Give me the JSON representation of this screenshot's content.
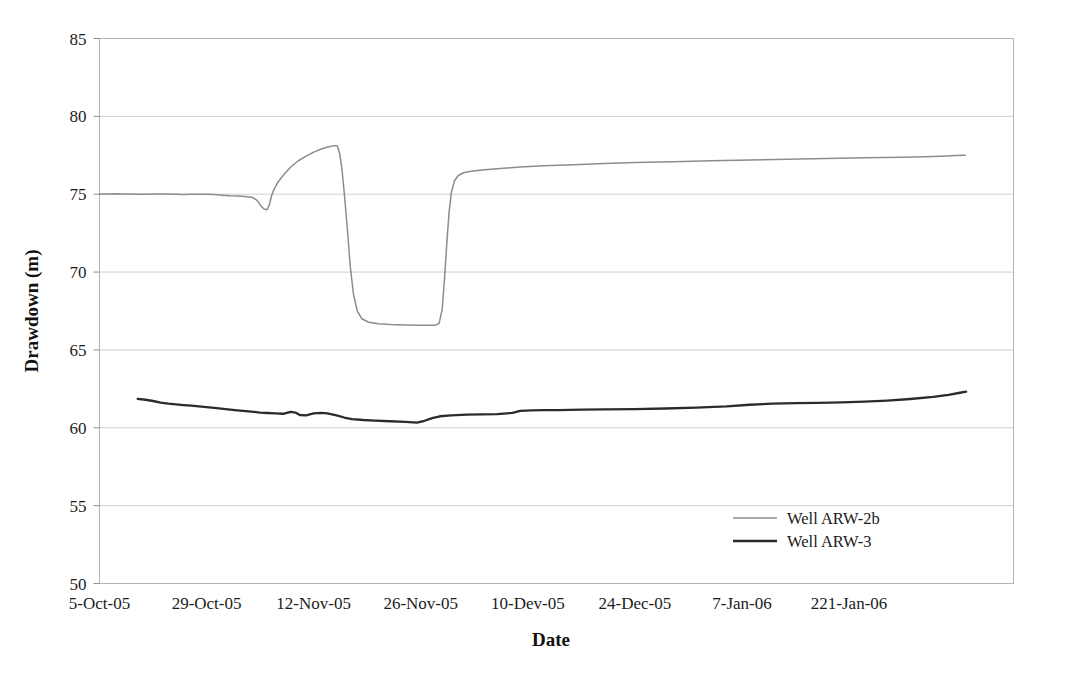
{
  "chart_data": {
    "type": "line",
    "title": "",
    "xlabel": "Date",
    "ylabel": "Drawdown (m)",
    "ylim": [
      50,
      85
    ],
    "yticks": [
      50,
      55,
      60,
      65,
      70,
      75,
      80,
      85
    ],
    "ytick_labels": [
      "50",
      "55",
      "60",
      "65",
      "70",
      "75",
      "80",
      "85"
    ],
    "xtick_labels": [
      "5-Oct-05",
      "29-Oct-05",
      "12-Nov-05",
      "26-Nov-05",
      "10-Dev-05",
      "24-Dec-05",
      "7-Jan-06",
      "221-Jan-06"
    ],
    "grid": "horizontal",
    "legend_position": "inside-bottom-right",
    "colors": {
      "series_1": "#8c8c8c",
      "series_2": "#2b2b2b",
      "grid": "#c8c8c8",
      "frame": "#b4b4b4",
      "text": "#1c1c1c"
    },
    "series": [
      {
        "name": "Well ARW-2b",
        "color": "#8c8c8c",
        "points": [
          [
            0.0,
            75.02
          ],
          [
            1.0,
            75.02
          ],
          [
            2.0,
            75.03
          ],
          [
            3.0,
            75.02
          ],
          [
            4.0,
            75.01
          ],
          [
            5.0,
            75.0
          ],
          [
            6.0,
            75.0
          ],
          [
            7.0,
            75.01
          ],
          [
            8.0,
            75.02
          ],
          [
            9.0,
            75.02
          ],
          [
            10.0,
            75.0
          ],
          [
            11.0,
            74.98
          ],
          [
            12.0,
            74.99
          ],
          [
            13.0,
            75.0
          ],
          [
            14.0,
            75.0
          ],
          [
            15.0,
            74.98
          ],
          [
            16.0,
            74.94
          ],
          [
            17.0,
            74.9
          ],
          [
            18.0,
            74.88
          ],
          [
            19.0,
            74.86
          ],
          [
            20.0,
            74.8
          ],
          [
            20.6,
            74.6
          ],
          [
            21.1,
            74.25
          ],
          [
            21.5,
            74.05
          ],
          [
            21.9,
            74.0
          ],
          [
            22.2,
            74.3
          ],
          [
            22.5,
            74.9
          ],
          [
            22.8,
            75.3
          ],
          [
            23.3,
            75.75
          ],
          [
            24.0,
            76.2
          ],
          [
            25.0,
            76.75
          ],
          [
            26.0,
            77.15
          ],
          [
            27.0,
            77.45
          ],
          [
            28.0,
            77.7
          ],
          [
            29.0,
            77.9
          ],
          [
            30.0,
            78.05
          ],
          [
            30.7,
            78.12
          ],
          [
            31.1,
            78.1
          ],
          [
            31.4,
            77.6
          ],
          [
            31.7,
            76.6
          ],
          [
            32.0,
            75.1
          ],
          [
            32.4,
            72.8
          ],
          [
            32.8,
            70.3
          ],
          [
            33.2,
            68.6
          ],
          [
            33.7,
            67.5
          ],
          [
            34.3,
            67.0
          ],
          [
            35.2,
            66.78
          ],
          [
            36.5,
            66.68
          ],
          [
            38.0,
            66.63
          ],
          [
            40.0,
            66.6
          ],
          [
            42.0,
            66.58
          ],
          [
            43.8,
            66.58
          ],
          [
            44.4,
            66.7
          ],
          [
            44.8,
            67.6
          ],
          [
            45.1,
            69.5
          ],
          [
            45.4,
            71.8
          ],
          [
            45.7,
            73.8
          ],
          [
            46.0,
            75.1
          ],
          [
            46.4,
            75.85
          ],
          [
            46.9,
            76.2
          ],
          [
            47.6,
            76.38
          ],
          [
            48.6,
            76.48
          ],
          [
            50.0,
            76.56
          ],
          [
            52.0,
            76.64
          ],
          [
            55.0,
            76.74
          ],
          [
            58.0,
            76.82
          ],
          [
            62.0,
            76.9
          ],
          [
            66.0,
            76.97
          ],
          [
            70.0,
            77.03
          ],
          [
            75.0,
            77.09
          ],
          [
            80.0,
            77.15
          ],
          [
            85.0,
            77.2
          ],
          [
            90.0,
            77.25
          ],
          [
            95.0,
            77.3
          ],
          [
            100.0,
            77.34
          ],
          [
            105.0,
            77.38
          ],
          [
            108.0,
            77.41
          ],
          [
            110.0,
            77.44
          ],
          [
            112.0,
            77.48
          ],
          [
            113.2,
            77.51
          ]
        ]
      },
      {
        "name": "Well ARW-3",
        "color": "#2b2b2b",
        "points": [
          [
            5.0,
            61.85
          ],
          [
            6.0,
            61.8
          ],
          [
            7.0,
            61.72
          ],
          [
            8.0,
            61.62
          ],
          [
            9.0,
            61.55
          ],
          [
            10.0,
            61.5
          ],
          [
            11.0,
            61.46
          ],
          [
            12.0,
            61.42
          ],
          [
            13.0,
            61.38
          ],
          [
            14.0,
            61.33
          ],
          [
            15.0,
            61.28
          ],
          [
            16.5,
            61.2
          ],
          [
            18.0,
            61.12
          ],
          [
            19.5,
            61.05
          ],
          [
            21.0,
            60.98
          ],
          [
            22.0,
            60.95
          ],
          [
            23.0,
            60.92
          ],
          [
            24.0,
            60.9
          ],
          [
            25.0,
            61.02
          ],
          [
            25.6,
            60.98
          ],
          [
            26.2,
            60.82
          ],
          [
            27.0,
            60.8
          ],
          [
            28.0,
            60.92
          ],
          [
            29.0,
            60.96
          ],
          [
            29.8,
            60.92
          ],
          [
            31.0,
            60.8
          ],
          [
            32.0,
            60.66
          ],
          [
            33.0,
            60.56
          ],
          [
            34.5,
            60.5
          ],
          [
            36.0,
            60.46
          ],
          [
            38.0,
            60.42
          ],
          [
            40.0,
            60.38
          ],
          [
            41.5,
            60.33
          ],
          [
            42.5,
            60.45
          ],
          [
            43.5,
            60.62
          ],
          [
            44.5,
            60.74
          ],
          [
            46.0,
            60.8
          ],
          [
            48.0,
            60.84
          ],
          [
            50.0,
            60.86
          ],
          [
            52.0,
            60.88
          ],
          [
            54.0,
            60.96
          ],
          [
            55.0,
            61.08
          ],
          [
            56.5,
            61.12
          ],
          [
            58.0,
            61.13
          ],
          [
            60.0,
            61.14
          ],
          [
            63.0,
            61.16
          ],
          [
            66.0,
            61.18
          ],
          [
            70.0,
            61.2
          ],
          [
            74.0,
            61.24
          ],
          [
            78.0,
            61.3
          ],
          [
            82.0,
            61.38
          ],
          [
            85.0,
            61.48
          ],
          [
            88.0,
            61.55
          ],
          [
            91.0,
            61.58
          ],
          [
            94.0,
            61.6
          ],
          [
            97.0,
            61.63
          ],
          [
            100.0,
            61.68
          ],
          [
            103.0,
            61.75
          ],
          [
            106.0,
            61.85
          ],
          [
            109.0,
            61.98
          ],
          [
            111.0,
            62.12
          ],
          [
            112.5,
            62.25
          ],
          [
            113.3,
            62.32
          ]
        ]
      }
    ]
  },
  "legend": {
    "items": [
      {
        "label": "Well ARW-2b",
        "color": "#8c8c8c"
      },
      {
        "label": "Well ARW-3",
        "color": "#2b2b2b"
      }
    ]
  },
  "axes": {
    "y_title": "Drawdown (m)",
    "x_title": "Date"
  }
}
